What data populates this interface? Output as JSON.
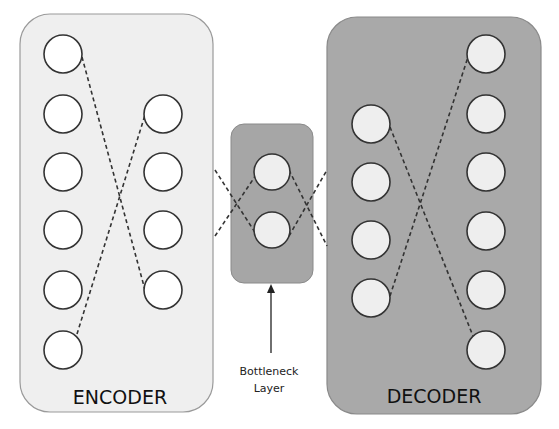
{
  "diagram": {
    "colors": {
      "encoder_fill": "#efefef",
      "encoder_stroke": "#9a9a9a",
      "decoder_fill": "#a9a9a9",
      "decoder_stroke": "#8a8a8a",
      "bottleneck_fill": "#a6a6a6",
      "node_fill_light": "#ffffff",
      "node_fill_dark": "#eeeeee",
      "node_stroke": "#333333",
      "dash": "#333333"
    },
    "encoder": {
      "label": "ENCODER",
      "layers": [
        {
          "name": "input",
          "nodes": 6
        },
        {
          "name": "hidden",
          "nodes": 4
        }
      ]
    },
    "bottleneck": {
      "label_line1": "Bottleneck",
      "label_line2": "Layer",
      "nodes": 2
    },
    "decoder": {
      "label": "DECODER",
      "layers": [
        {
          "name": "hidden",
          "nodes": 4
        },
        {
          "name": "output",
          "nodes": 6
        }
      ]
    }
  }
}
